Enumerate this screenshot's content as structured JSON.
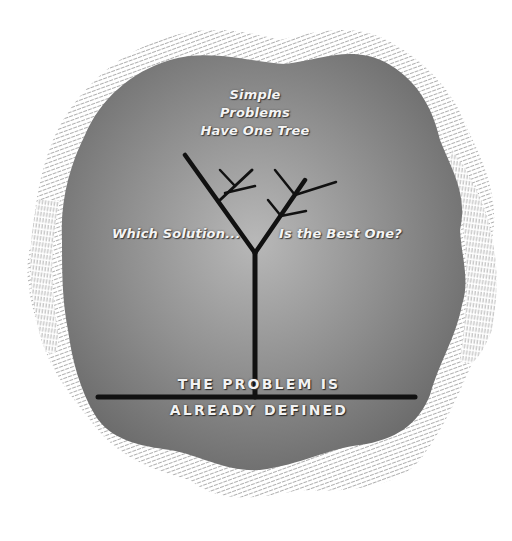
{
  "diagram": {
    "title_lines": [
      "Simple",
      "Problems",
      "Have One Tree"
    ],
    "left_label": "Which Solution...",
    "right_label": "Is the Best One?",
    "base_label_lines": [
      "THE PROBLEM IS",
      "ALREADY DEFINED"
    ],
    "colors": {
      "background": "#ffffff",
      "blob_center": "#b3b3b3",
      "blob_edge": "#6a6a6a",
      "hatch": "#9a9a9a",
      "tree": "#111111",
      "label_text": "#f4f4f4"
    },
    "elements": {
      "blob": "wavy-rounded-shape",
      "halo": "hatched-wavy-outline",
      "tree": "branching-tree-two-main-limbs",
      "baseline": "horizontal-ground-line"
    }
  }
}
